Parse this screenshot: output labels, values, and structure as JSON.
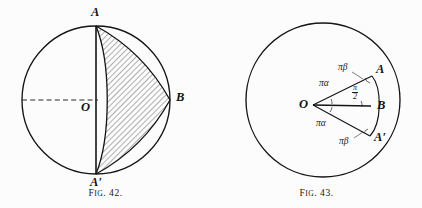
{
  "plate": {
    "background_color": "#fcfcfc",
    "ink_color": "#141414",
    "figures": [
      {
        "id": "fig-42",
        "caption_prefix": "F",
        "caption_smallcaps": "IG",
        "caption_number": ". 42.",
        "caption_full": "Fig. 42.",
        "description": "Circle with vertical diameter A A-prime, dashed horizontal radius through center O, and a hatched three-cusped hypocycloid (deltoid) region with cusps at A, A-prime and B.",
        "circle": {
          "cx": 96,
          "cy": 100,
          "r": 74,
          "stroke": "#141414"
        },
        "labels": {
          "A": "A",
          "A_prime": "A′",
          "B": "B",
          "O": "O"
        },
        "points": {
          "A": {
            "x": 96,
            "y": 26
          },
          "A_prime": {
            "x": 96,
            "y": 174
          },
          "B": {
            "x": 170,
            "y": 100
          },
          "O": {
            "x": 96,
            "y": 100
          }
        },
        "hatch": {
          "angle_deg": 45,
          "spacing_px": 4,
          "stroke": "#2b2b2b"
        },
        "dashed_radius": {
          "from_x": 22,
          "to_x": 96,
          "y": 100
        }
      },
      {
        "id": "fig-43",
        "caption_prefix": "F",
        "caption_smallcaps": "IG",
        "caption_number": ". 43.",
        "caption_full": "Fig. 43.",
        "description": "Circle with center O; rays from O to A and A-prime and a horizontal ray O to B, with angles labeled pi-alpha, pi-beta and pi over 2; arc bulging right joins A to A-prime through B.",
        "circle": {
          "cx": 112,
          "cy": 100,
          "r": 77,
          "stroke": "#141414"
        },
        "labels": {
          "A": "A",
          "A_prime": "A′",
          "B": "B",
          "O": "O"
        },
        "points": {
          "O": {
            "x": 102,
            "y": 105
          },
          "A": {
            "x": 161,
            "y": 76
          },
          "A_prime": {
            "x": 159,
            "y": 136
          },
          "B": {
            "x": 160,
            "y": 106
          }
        },
        "angle_labels": {
          "pi_beta_top": "πβ",
          "pi_alpha_top": "πα",
          "pi_over_two_num": "π",
          "pi_over_two_den": "2",
          "pi_alpha_bottom": "πα",
          "pi_beta_bottom": "πβ"
        }
      }
    ]
  }
}
